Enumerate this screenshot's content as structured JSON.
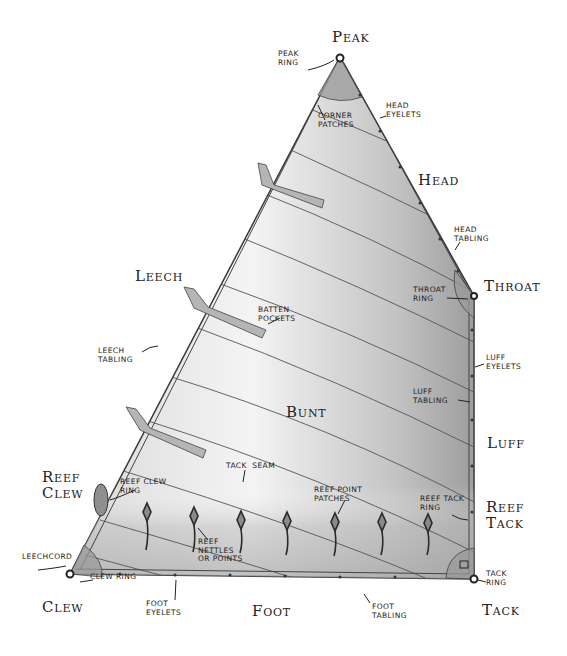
{
  "colors": {
    "outline": "#3a3a3a",
    "sail_light": "#f2f2f2",
    "sail_mid": "#c8c8c8",
    "sail_dark": "#8f8f8f",
    "patch": "#9a9a9a",
    "text": "#222222"
  },
  "corners": {
    "peak": "Peak",
    "throat": "Throat",
    "tack": "Tack",
    "clew": "Clew",
    "reef_clew": "Reef\nClew",
    "reef_tack": "Reef\nTack"
  },
  "edges": {
    "head": "Head",
    "leech": "Leech",
    "luff": "Luff",
    "foot": "Foot"
  },
  "area": {
    "bunt": "Bunt"
  },
  "callouts": {
    "peak_ring": "Peak\nring",
    "corner_patches": "Corner\npatches",
    "head_eyelets": "Head\neyelets",
    "head_tabling": "Head\ntabling",
    "throat_ring": "Throat\nring",
    "luff_eyelets": "Luff\neyelets",
    "luff_tabling": "Luff\ntabling",
    "batten_pockets": "Batten\npockets",
    "leech_tabling": "Leech\ntabling",
    "tack_seam": "Tack  seam",
    "reef_clew_ring": "Reef clew\nring",
    "reef_point_patches": "Reef point\npatches",
    "reef_tack_ring": "Reef tack\nring",
    "reef_nettles": "Reef\nnettles\nor points",
    "leechcord": "Leechcord",
    "clew_ring": "Clew ring",
    "tack_ring": "Tack\nring",
    "foot_eyelets": "Foot\neyelets",
    "foot_tabling": "Foot\ntabling"
  }
}
